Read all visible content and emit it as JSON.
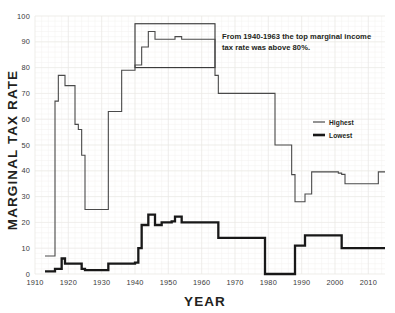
{
  "chart_data": {
    "type": "line",
    "title": "",
    "xlabel": "YEAR",
    "ylabel": "MARGINAL TAX RATE",
    "xlim": [
      1910,
      2015
    ],
    "ylim": [
      0,
      100
    ],
    "grid": true,
    "legend_position": "right-middle",
    "x_ticks": [
      1910,
      1920,
      1930,
      1940,
      1950,
      1960,
      1970,
      1980,
      1990,
      2000,
      2010
    ],
    "y_ticks": [
      0,
      10,
      20,
      30,
      40,
      50,
      60,
      70,
      80,
      90,
      100
    ],
    "annotations": [
      {
        "text_line_1": "From 1940-1963 the top marginal income",
        "text_line_2": "tax rate was above 80%.",
        "highlight_box": {
          "x_start": 1940,
          "x_end": 1964,
          "y_bottom": 80,
          "y_top": 97
        }
      }
    ],
    "series": [
      {
        "name": "Highest",
        "style": "thin",
        "color": "#4a4a4a",
        "x": [
          1913,
          1915,
          1916,
          1917,
          1918,
          1919,
          1921,
          1922,
          1923,
          1924,
          1925,
          1931,
          1932,
          1935,
          1936,
          1939,
          1940,
          1941,
          1942,
          1944,
          1945,
          1946,
          1951,
          1952,
          1953,
          1954,
          1963,
          1964,
          1965,
          1981,
          1982,
          1986,
          1987,
          1988,
          1990,
          1991,
          1992,
          1993,
          2000,
          2001,
          2002,
          2003,
          2012,
          2013,
          2015
        ],
        "y": [
          7,
          7,
          67,
          77,
          77,
          73,
          73,
          58,
          56,
          46,
          25,
          25,
          63,
          63,
          79,
          79,
          81,
          81,
          88,
          94,
          94,
          91,
          91,
          92,
          92,
          91,
          91,
          77,
          70,
          70,
          50,
          50,
          38.5,
          28,
          28,
          31,
          31,
          39.6,
          39.6,
          39.1,
          38.6,
          35,
          35,
          39.6,
          39.6
        ]
      },
      {
        "name": "Lowest",
        "style": "thick",
        "color": "#181818",
        "x": [
          1913,
          1916,
          1917,
          1918,
          1919,
          1922,
          1924,
          1925,
          1929,
          1930,
          1932,
          1936,
          1940,
          1941,
          1942,
          1944,
          1946,
          1948,
          1950,
          1951,
          1952,
          1954,
          1964,
          1965,
          1977,
          1979,
          1982,
          1987,
          1988,
          1991,
          2001,
          2002,
          2003,
          2015
        ],
        "y": [
          1,
          2,
          2,
          6,
          4,
          4,
          2,
          1.5,
          1.5,
          1.5,
          4,
          4,
          4.4,
          10,
          19,
          23,
          19,
          20,
          20,
          20.4,
          22.2,
          20,
          20,
          14,
          14,
          0,
          0,
          0,
          11,
          15,
          15,
          10,
          10,
          10
        ]
      }
    ]
  },
  "legend": {
    "items": [
      {
        "label": "Highest",
        "style": "thin"
      },
      {
        "label": "Lowest",
        "style": "thick"
      }
    ]
  },
  "axes": {
    "y_title": "MARGINAL TAX RATE",
    "x_title": "YEAR",
    "y_tick_labels": [
      "0",
      "10",
      "20",
      "30",
      "40",
      "50",
      "60",
      "70",
      "80",
      "90",
      "100"
    ],
    "x_tick_labels": [
      "1910",
      "1920",
      "1930",
      "1940",
      "1950",
      "1960",
      "1970",
      "1980",
      "1990",
      "2000",
      "2010"
    ]
  }
}
